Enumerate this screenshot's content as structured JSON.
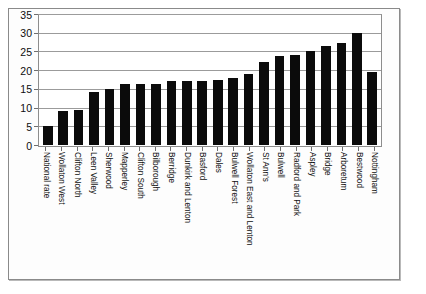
{
  "chart_data": {
    "type": "bar",
    "title": "",
    "subtitle": "",
    "xlabel": "",
    "ylabel": "",
    "ylim": [
      0,
      35
    ],
    "yticks": [
      0,
      5,
      10,
      15,
      20,
      25,
      30,
      35
    ],
    "grid": true,
    "legend": false,
    "orientation": "vertical",
    "bar_color": "#0b0b0b",
    "categories": [
      "National rate",
      "Wollaton West",
      "Clifton North",
      "Leen Valley",
      "Sherwood",
      "Mapperley",
      "Clifton South",
      "Bilborough",
      "Berridge",
      "Dunkirk and Lenton",
      "Basford",
      "Dales",
      "Bulwell Forest",
      "Wollaton East and Lenton",
      "St Ann's",
      "Bulwell",
      "Radford and Park",
      "Aspley",
      "Bridge",
      "Arboretum",
      "Bestwood",
      "Nottingham"
    ],
    "values": [
      5.2,
      9.0,
      9.3,
      14.2,
      14.9,
      16.3,
      16.2,
      16.3,
      17.0,
      17.0,
      17.2,
      17.5,
      18.0,
      19.0,
      22.2,
      23.8,
      24.0,
      25.0,
      26.5,
      27.2,
      29.8,
      19.5
    ]
  },
  "axis": {
    "y_tick_labels": [
      "0",
      "5",
      "10",
      "15",
      "20",
      "25",
      "30",
      "35"
    ]
  }
}
